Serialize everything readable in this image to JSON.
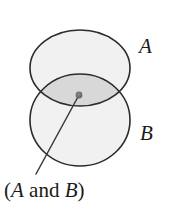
{
  "figure": {
    "type": "venn-diagram",
    "background_color": "#ffffff",
    "outline_color": "#2b2b2b",
    "set_fill_color": "#f1f1f1",
    "intersection_fill_color": "#d8d8d8",
    "marker_color": "#6f6f6f",
    "leader_line_color": "#3a3a3a"
  },
  "sets": [
    {
      "id": "A",
      "label": "A",
      "label_position": "upper-right",
      "cx": 80,
      "cy": 68,
      "rx": 50,
      "ry": 38
    },
    {
      "id": "B",
      "label": "B",
      "label_position": "lower-right",
      "cx": 80,
      "cy": 120,
      "rx": 50,
      "ry": 46
    }
  ],
  "annotation": {
    "text_parts": {
      "open_paren": "(",
      "first_set": "A",
      "conjunction": " and ",
      "second_set": "B",
      "close_paren": ")"
    },
    "full_text": "(A and B)",
    "marker_point": {
      "x": 79,
      "y": 95
    },
    "leader_line_end": {
      "x": 36,
      "y": 174
    }
  }
}
